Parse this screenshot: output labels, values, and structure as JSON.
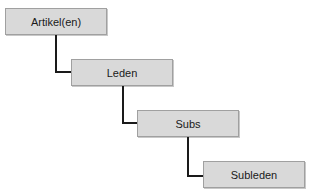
{
  "diagram": {
    "nodes": [
      {
        "id": "artikelen",
        "label": "Artikel(en)",
        "level": 0
      },
      {
        "id": "leden",
        "label": "Leden",
        "level": 1
      },
      {
        "id": "subs",
        "label": "Subs",
        "level": 2
      },
      {
        "id": "subleden",
        "label": "Subleden",
        "level": 3
      }
    ],
    "edges": [
      {
        "from": "artikelen",
        "to": "leden"
      },
      {
        "from": "leden",
        "to": "subs"
      },
      {
        "from": "subs",
        "to": "subleden"
      }
    ],
    "colors": {
      "box_fill": "#d9d9d9",
      "box_border": "#a0a0a0",
      "connector": "#1a1a1a"
    }
  }
}
